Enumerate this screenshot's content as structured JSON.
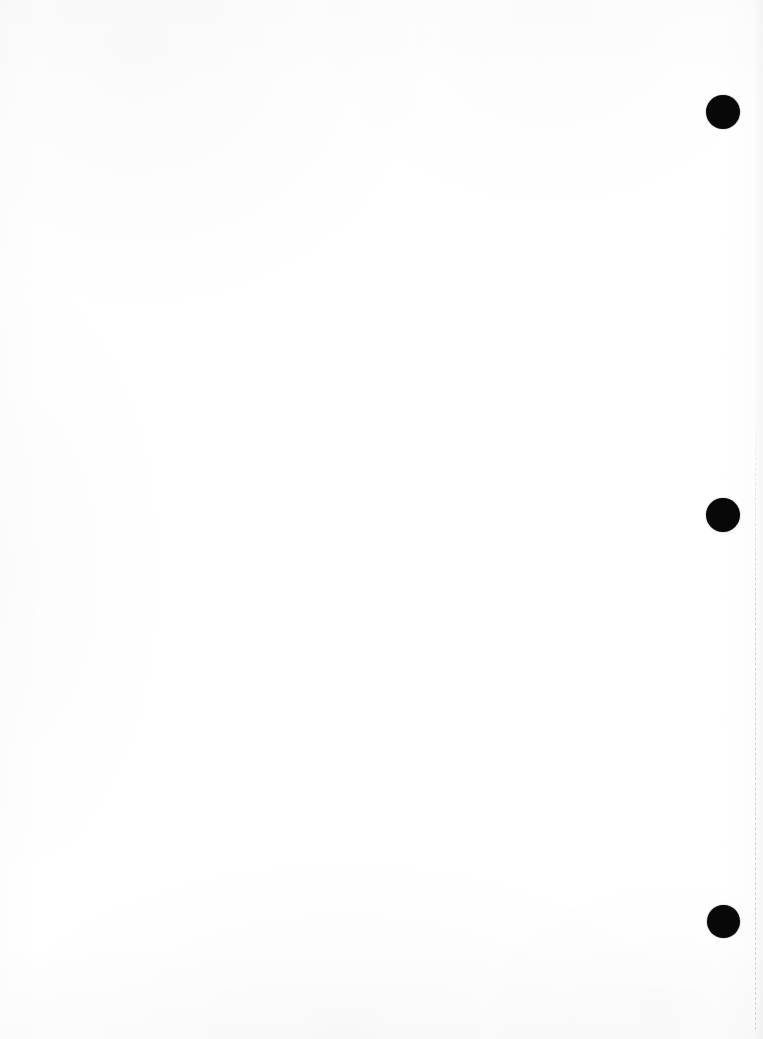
{
  "page": {
    "label": "Scanned blank page",
    "width": 763,
    "height": 1039,
    "background_color": "#ffffff",
    "content_text": "",
    "content_note": "blank page — no text"
  },
  "marks": {
    "color": "#080808",
    "count": 3,
    "items": [
      {
        "name": "registration-mark-top",
        "cx": 723,
        "cy": 112,
        "d": 34
      },
      {
        "name": "registration-mark-middle",
        "cx": 723,
        "cy": 515,
        "d": 34
      },
      {
        "name": "registration-mark-bottom",
        "cx": 723,
        "cy": 921,
        "d": 33
      }
    ]
  },
  "perforation": {
    "name": "perforation-line",
    "color": "#000000",
    "opacity": 0.16,
    "x": 755,
    "y_start": 398,
    "y_end": 1030,
    "dash": "dashed"
  }
}
